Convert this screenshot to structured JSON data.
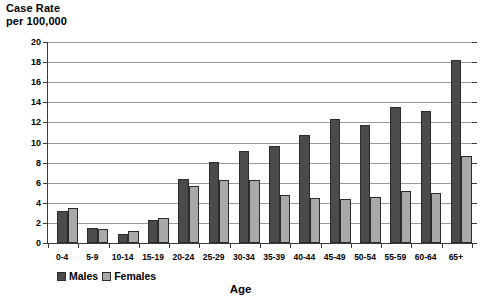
{
  "chart_data": {
    "type": "bar",
    "title": "",
    "ylabel": "Case Rate\nper 100,000",
    "xlabel": "Age",
    "ylim": [
      0,
      20
    ],
    "ytick_step": 2,
    "yticks": [
      0,
      2,
      4,
      6,
      8,
      10,
      12,
      14,
      16,
      18,
      20
    ],
    "grid": true,
    "legend_position": "bottom-left",
    "categories": [
      "0-4",
      "5-9",
      "10-14",
      "15-19",
      "20-24",
      "25-29",
      "30-34",
      "35-39",
      "40-44",
      "45-49",
      "50-54",
      "55-59",
      "60-64",
      "65+"
    ],
    "series": [
      {
        "name": "Males",
        "color": "#4b4b4b",
        "values": [
          3.2,
          1.5,
          0.9,
          2.3,
          6.4,
          8.1,
          9.2,
          9.7,
          10.7,
          12.3,
          11.7,
          13.5,
          13.1,
          18.2
        ]
      },
      {
        "name": "Females",
        "color": "#a9a9a9",
        "values": [
          3.5,
          1.4,
          1.2,
          2.5,
          5.7,
          6.3,
          6.3,
          4.8,
          4.5,
          4.4,
          4.6,
          5.2,
          5.0,
          8.7
        ]
      }
    ]
  },
  "axes": {
    "y_title": "Case Rate\nper 100,000",
    "x_title": "Age"
  },
  "legend": {
    "items": [
      {
        "label": "Males"
      },
      {
        "label": "Females"
      }
    ]
  },
  "colors": {
    "male_bar": "#4b4b4b",
    "female_bar": "#a9a9a9",
    "axis": "#3a3a3a",
    "gridline": "#9a9a9a",
    "background": "#ffffff"
  }
}
